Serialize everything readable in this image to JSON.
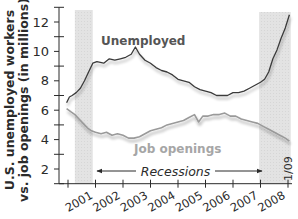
{
  "chart_data": {
    "type": "line",
    "title": "",
    "ylabel_lines": [
      "U.S. unemployed workers",
      "vs. job openings (in millions)"
    ],
    "xlabel": "",
    "ylim": [
      1,
      13
    ],
    "y_ticks": [
      2,
      4,
      6,
      8,
      10,
      12
    ],
    "x_tick_labels": [
      "2001",
      "2002",
      "2003",
      "2004",
      "2005",
      "2006",
      "2007",
      "2008"
    ],
    "grid": false,
    "legend": "inline labels",
    "series": [
      {
        "name": "Unemployed",
        "color": "#3a3a3a",
        "points": [
          [
            2000.95,
            6.5
          ],
          [
            2001.05,
            6.9
          ],
          [
            2001.15,
            7.0
          ],
          [
            2001.3,
            7.2
          ],
          [
            2001.45,
            7.5
          ],
          [
            2001.6,
            8.0
          ],
          [
            2001.75,
            8.6
          ],
          [
            2001.9,
            9.2
          ],
          [
            2002.05,
            9.3
          ],
          [
            2002.3,
            9.2
          ],
          [
            2002.5,
            9.5
          ],
          [
            2002.7,
            9.4
          ],
          [
            2002.9,
            9.5
          ],
          [
            2003.1,
            9.6
          ],
          [
            2003.3,
            9.8
          ],
          [
            2003.45,
            10.3
          ],
          [
            2003.6,
            9.8
          ],
          [
            2003.8,
            9.4
          ],
          [
            2004.0,
            9.2
          ],
          [
            2004.2,
            8.9
          ],
          [
            2004.4,
            8.7
          ],
          [
            2004.6,
            8.6
          ],
          [
            2004.8,
            8.4
          ],
          [
            2005.0,
            8.1
          ],
          [
            2005.2,
            8.0
          ],
          [
            2005.4,
            7.9
          ],
          [
            2005.6,
            7.6
          ],
          [
            2005.8,
            7.4
          ],
          [
            2006.0,
            7.3
          ],
          [
            2006.2,
            7.2
          ],
          [
            2006.4,
            7.0
          ],
          [
            2006.6,
            7.0
          ],
          [
            2006.8,
            7.0
          ],
          [
            2007.0,
            7.2
          ],
          [
            2007.2,
            7.2
          ],
          [
            2007.4,
            7.3
          ],
          [
            2007.6,
            7.5
          ],
          [
            2007.8,
            7.7
          ],
          [
            2008.0,
            7.9
          ],
          [
            2008.15,
            8.1
          ],
          [
            2008.3,
            8.6
          ],
          [
            2008.45,
            9.5
          ],
          [
            2008.6,
            10.1
          ],
          [
            2008.75,
            10.9
          ],
          [
            2008.9,
            11.6
          ],
          [
            2009.05,
            12.5
          ]
        ]
      },
      {
        "name": "Job openings",
        "color": "#9a9a9a",
        "points": [
          [
            2000.95,
            6.1
          ],
          [
            2001.1,
            5.9
          ],
          [
            2001.25,
            5.7
          ],
          [
            2001.4,
            5.4
          ],
          [
            2001.55,
            5.1
          ],
          [
            2001.7,
            4.8
          ],
          [
            2001.85,
            4.6
          ],
          [
            2002.0,
            4.5
          ],
          [
            2002.2,
            4.4
          ],
          [
            2002.4,
            4.5
          ],
          [
            2002.6,
            4.3
          ],
          [
            2002.8,
            4.4
          ],
          [
            2003.0,
            4.3
          ],
          [
            2003.2,
            4.1
          ],
          [
            2003.4,
            4.1
          ],
          [
            2003.6,
            4.2
          ],
          [
            2003.8,
            4.4
          ],
          [
            2004.0,
            4.6
          ],
          [
            2004.2,
            4.7
          ],
          [
            2004.4,
            4.8
          ],
          [
            2004.6,
            5.0
          ],
          [
            2004.8,
            5.1
          ],
          [
            2005.0,
            5.2
          ],
          [
            2005.2,
            5.3
          ],
          [
            2005.4,
            5.5
          ],
          [
            2005.6,
            5.7
          ],
          [
            2005.75,
            5.2
          ],
          [
            2005.9,
            5.6
          ],
          [
            2006.1,
            5.6
          ],
          [
            2006.3,
            5.7
          ],
          [
            2006.5,
            5.7
          ],
          [
            2006.7,
            5.8
          ],
          [
            2006.9,
            5.6
          ],
          [
            2007.1,
            5.6
          ],
          [
            2007.3,
            5.4
          ],
          [
            2007.5,
            5.3
          ],
          [
            2007.7,
            5.2
          ],
          [
            2007.9,
            5.1
          ],
          [
            2008.1,
            4.9
          ],
          [
            2008.3,
            4.7
          ],
          [
            2008.5,
            4.5
          ],
          [
            2008.7,
            4.3
          ],
          [
            2008.9,
            4.1
          ],
          [
            2009.05,
            3.9
          ]
        ]
      }
    ],
    "recessions": [
      {
        "start": 2001.25,
        "end": 2001.9
      },
      {
        "start": 2007.95,
        "end": 2009.1
      }
    ],
    "annotations": {
      "recessions_label": "Recessions",
      "end_date_label": "1/09",
      "unemployed_label": "Unemployed",
      "job_openings_label": "Job openings"
    }
  }
}
